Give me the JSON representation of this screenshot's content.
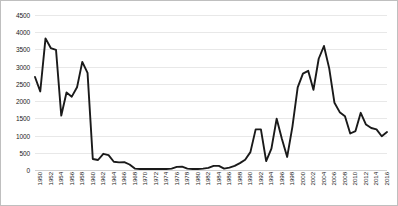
{
  "chart_data": {
    "type": "line",
    "title": "",
    "subtitle": "",
    "xlabel": "",
    "ylabel": "",
    "ylim": [
      0,
      4500
    ],
    "xlim": [
      1950,
      2017
    ],
    "grid": true,
    "grid_axis": "y",
    "legend": false,
    "legend_position": "none",
    "line_color": "#1a1a1a",
    "background_color": "#ffffff",
    "gridline_color": "#e8e8e8",
    "border_color": "#bfbfbf",
    "y_ticks": [
      0,
      500,
      1000,
      1500,
      2000,
      2500,
      3000,
      3500,
      4000,
      4500
    ],
    "y_tick_labels": [
      "0",
      "500",
      "1000",
      "1500",
      "2000",
      "2500",
      "3000",
      "3500",
      "4000",
      "4500"
    ],
    "x_tick_labels": [
      "1950",
      "1952",
      "1954",
      "1956",
      "1958",
      "1960",
      "1962",
      "1964",
      "1966",
      "1968",
      "1970",
      "1972",
      "1974",
      "1976",
      "1978",
      "1980",
      "1982",
      "1984",
      "1986",
      "1988",
      "1990",
      "1992",
      "1994",
      "1996",
      "1998",
      "2000",
      "2002",
      "2004",
      "2006",
      "2008",
      "2010",
      "2012",
      "2014",
      "2016"
    ],
    "x_tick_interval": 2,
    "x": [
      1950,
      1951,
      1952,
      1953,
      1954,
      1955,
      1956,
      1957,
      1958,
      1959,
      1960,
      1961,
      1962,
      1963,
      1964,
      1965,
      1966,
      1967,
      1968,
      1969,
      1970,
      1971,
      1972,
      1973,
      1974,
      1975,
      1976,
      1977,
      1978,
      1979,
      1980,
      1981,
      1982,
      1983,
      1984,
      1985,
      1986,
      1987,
      1988,
      1989,
      1990,
      1991,
      1992,
      1993,
      1994,
      1995,
      1996,
      1997,
      1998,
      1999,
      2000,
      2001,
      2002,
      2003,
      2004,
      2005,
      2006,
      2007,
      2008,
      2009,
      2010,
      2011,
      2012,
      2013,
      2014,
      2015,
      2016,
      2017
    ],
    "series": [
      {
        "name": "Series 1",
        "color": "#1a1a1a",
        "values": [
          2700,
          2280,
          3820,
          3540,
          3490,
          1580,
          2250,
          2130,
          2400,
          3140,
          2820,
          320,
          290,
          470,
          430,
          240,
          220,
          230,
          160,
          40,
          30,
          30,
          30,
          30,
          30,
          30,
          40,
          90,
          95,
          40,
          30,
          30,
          40,
          60,
          120,
          120,
          40,
          70,
          120,
          200,
          300,
          520,
          1180,
          1180,
          260,
          620,
          1490,
          900,
          380,
          1260,
          2400,
          2800,
          2880,
          2330,
          3230,
          3600,
          2950,
          1950,
          1680,
          1560,
          1060,
          1130,
          1660,
          1320,
          1220,
          1180,
          980,
          1100
        ]
      }
    ]
  }
}
